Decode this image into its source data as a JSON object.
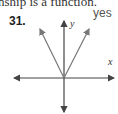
{
  "header": {
    "cropped_text": "nship is a function."
  },
  "problem": {
    "number": "31.",
    "answer": "yes"
  },
  "graph": {
    "x_label": "x",
    "y_label": "y",
    "description": "V-shaped graph with vertex at origin, arrows on both branches",
    "axis_color": "#444444",
    "curve_color": "#777777"
  }
}
